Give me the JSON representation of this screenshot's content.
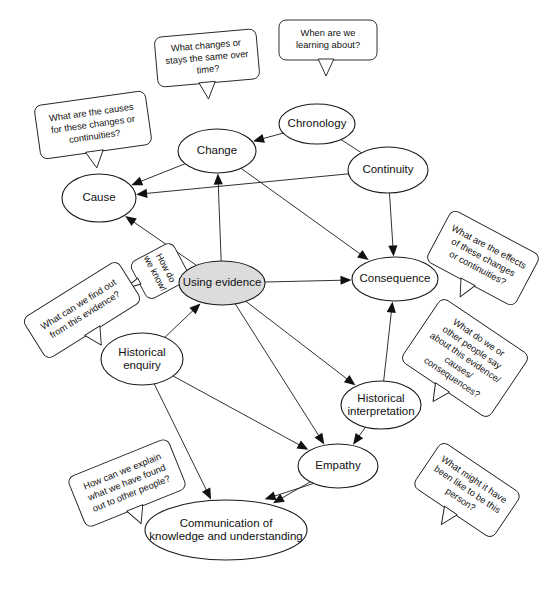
{
  "diagram": {
    "type": "concept-map",
    "colors": {
      "background": "#ffffff",
      "stroke": "#1a1a1a",
      "text": "#111111",
      "accent_node_fill": "#dcdcdc",
      "node_fill": "#ffffff"
    },
    "nodes": [
      {
        "id": "cause",
        "label": "Cause",
        "cx": 99,
        "cy": 198,
        "rx": 37,
        "ry": 24,
        "accent": false,
        "lines": [
          "Cause"
        ]
      },
      {
        "id": "change",
        "label": "Change",
        "cx": 217,
        "cy": 151,
        "rx": 39,
        "ry": 22,
        "accent": false,
        "lines": [
          "Change"
        ]
      },
      {
        "id": "chronology",
        "label": "Chronology",
        "cx": 317,
        "cy": 124,
        "rx": 38,
        "ry": 20,
        "accent": false,
        "lines": [
          "Chronology"
        ]
      },
      {
        "id": "continuity",
        "label": "Continuity",
        "cx": 388,
        "cy": 170,
        "rx": 40,
        "ry": 23,
        "accent": false,
        "lines": [
          "Continuity"
        ]
      },
      {
        "id": "consequence",
        "label": "Consequence",
        "cx": 395,
        "cy": 279,
        "rx": 43,
        "ry": 22,
        "accent": false,
        "lines": [
          "Consequence"
        ]
      },
      {
        "id": "using-evidence",
        "label": "Using evidence",
        "cx": 222,
        "cy": 283,
        "rx": 43,
        "ry": 22,
        "accent": true,
        "lines": [
          "Using evidence"
        ]
      },
      {
        "id": "historical-enquiry",
        "label": "Historical enquiry",
        "cx": 142,
        "cy": 359,
        "rx": 41,
        "ry": 26,
        "accent": false,
        "lines": [
          "Historical",
          "enquiry"
        ]
      },
      {
        "id": "historical-interpretation",
        "label": "Historical interpretation",
        "cx": 381,
        "cy": 405,
        "rx": 40,
        "ry": 24,
        "accent": false,
        "lines": [
          "Historical",
          "interpretation"
        ]
      },
      {
        "id": "empathy",
        "label": "Empathy",
        "cx": 338,
        "cy": 466,
        "rx": 40,
        "ry": 22,
        "accent": false,
        "lines": [
          "Empathy"
        ]
      },
      {
        "id": "communication",
        "label": "Communication of knowledge and understanding",
        "cx": 226,
        "cy": 530,
        "rx": 81,
        "ry": 30,
        "accent": false,
        "lines": [
          "Communication of",
          "knowledge and understanding"
        ]
      }
    ],
    "callouts": [
      {
        "id": "causes-question",
        "text": "What are the causes for these changes or continuities?",
        "lines": [
          "What are the causes",
          "for these changes or",
          "continuities?"
        ],
        "cx": 93,
        "cy": 125,
        "w": 112,
        "h": 54,
        "rotate": -8,
        "tail": "points down to Cause"
      },
      {
        "id": "change-question",
        "text": "What changes or stays the same over time?",
        "lines": [
          "What changes or",
          "stays the same over",
          "time?"
        ],
        "cx": 207,
        "cy": 58,
        "w": 102,
        "h": 50,
        "rotate": -5,
        "tail": "points down to Change"
      },
      {
        "id": "chronology-question",
        "text": "When are we learning about?",
        "lines": [
          "When are we",
          "learning about?"
        ],
        "cx": 328,
        "cy": 40,
        "w": 98,
        "h": 40,
        "rotate": 0,
        "tail": "points down to Chronology"
      },
      {
        "id": "consequence-question",
        "text": "What are the effects of these changes or continuities?",
        "lines": [
          "What are the effects",
          "of these changes",
          "or continuities?"
        ],
        "cx": 483,
        "cy": 258,
        "w": 100,
        "h": 58,
        "rotate": 28,
        "tail": "points left to Consequence"
      },
      {
        "id": "evidence-know-question",
        "text": "How do we know!",
        "lines": [
          "How do",
          "we know!"
        ],
        "cx": 160,
        "cy": 271,
        "w": 42,
        "h": 48,
        "rotate": 62,
        "tail": "points right to Using evidence"
      },
      {
        "id": "find-out-question",
        "text": "What can we find out from this evidence?",
        "lines": [
          "What can we find out",
          "from this evidence?"
        ],
        "cx": 82,
        "cy": 310,
        "w": 112,
        "h": 48,
        "rotate": -32,
        "tail": "points right to Historical enquiry"
      },
      {
        "id": "interpretation-question",
        "text": "What do we or other people say about this evidence/ causes/ consequences?",
        "lines": [
          "What do we or",
          "other people say",
          "about this evidence/",
          "causes/",
          "consequences?"
        ],
        "cx": 465,
        "cy": 358,
        "w": 106,
        "h": 76,
        "rotate": 34,
        "tail": "points left to Historical interpretation"
      },
      {
        "id": "empathy-question",
        "text": "What might it have been like to be this person?",
        "lines": [
          "What might it have",
          "been like to be this",
          "person?"
        ],
        "cx": 467,
        "cy": 490,
        "w": 96,
        "h": 54,
        "rotate": 34,
        "tail": "points left to Empathy"
      },
      {
        "id": "communication-question",
        "text": "How can we explain what we have found out to other people?",
        "lines": [
          "How can we explain",
          "what we have found",
          "out to other people?"
        ],
        "cx": 127,
        "cy": 483,
        "w": 108,
        "h": 54,
        "rotate": -22,
        "tail": "points right to Communication"
      }
    ],
    "edges": [
      {
        "from": "change",
        "to": "cause",
        "arrow": true
      },
      {
        "from": "chronology",
        "to": "change",
        "arrow": true
      },
      {
        "from": "continuity",
        "to": "cause",
        "arrow": true
      },
      {
        "from": "chronology",
        "to": "continuity",
        "arrow": false
      },
      {
        "from": "continuity",
        "to": "consequence",
        "arrow": true
      },
      {
        "from": "change",
        "to": "consequence",
        "arrow": true
      },
      {
        "from": "using-evidence",
        "to": "cause",
        "arrow": true
      },
      {
        "from": "using-evidence",
        "to": "change",
        "arrow": true
      },
      {
        "from": "using-evidence",
        "to": "consequence",
        "arrow": true
      },
      {
        "from": "historical-enquiry",
        "to": "using-evidence",
        "arrow": true
      },
      {
        "from": "using-evidence",
        "to": "historical-interpretation",
        "arrow": true
      },
      {
        "from": "using-evidence",
        "to": "empathy",
        "arrow": true
      },
      {
        "from": "historical-interpretation",
        "to": "consequence",
        "arrow": true
      },
      {
        "from": "historical-interpretation",
        "to": "empathy",
        "arrow": true
      },
      {
        "from": "historical-enquiry",
        "to": "empathy",
        "arrow": true
      },
      {
        "from": "historical-enquiry",
        "to": "communication",
        "arrow": true
      },
      {
        "from": "empathy",
        "to": "communication",
        "arrow": true
      },
      {
        "from": "empathy",
        "to": "communication",
        "arrow": true
      }
    ]
  }
}
